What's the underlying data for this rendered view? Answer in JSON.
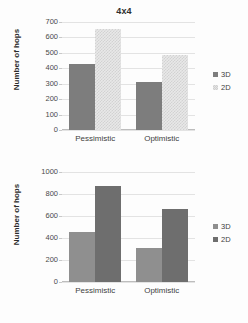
{
  "chart_data": [
    {
      "id": "top",
      "type": "bar",
      "title": "4x4",
      "xlabel": "",
      "ylabel": "Number of hops",
      "categories": [
        "Pessimistic",
        "Optimistic"
      ],
      "series": [
        {
          "name": "3D",
          "values": [
            428,
            313
          ],
          "style": "solid-dark"
        },
        {
          "name": "2D",
          "values": [
            652,
            487
          ],
          "style": "checker"
        }
      ],
      "ylim": [
        0,
        700
      ],
      "yticks": [
        0,
        100,
        200,
        300,
        400,
        500,
        600,
        700
      ],
      "ytick_labels": [
        "0",
        "100",
        "200",
        "300",
        "400",
        "500",
        "600",
        "700"
      ],
      "grid": true,
      "legend_position": "right"
    },
    {
      "id": "bottom",
      "type": "bar",
      "title": "",
      "xlabel": "",
      "ylabel": "Number of hops",
      "categories": [
        "Pessimistic",
        "Optimistic"
      ],
      "series": [
        {
          "name": "3D",
          "values": [
            455,
            310
          ],
          "style": "solid-mid"
        },
        {
          "name": "2D",
          "values": [
            875,
            665
          ],
          "style": "solid-darker"
        }
      ],
      "ylim": [
        0,
        1000
      ],
      "yticks": [
        0,
        200,
        400,
        600,
        800,
        1000
      ],
      "ytick_labels": [
        "0",
        "200",
        "400",
        "600",
        "800",
        "1000"
      ],
      "grid": true,
      "legend_position": "right"
    }
  ]
}
